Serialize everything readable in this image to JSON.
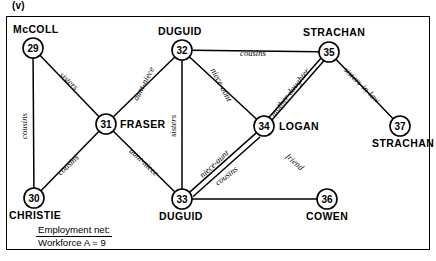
{
  "figure": {
    "panel_letter": "(v)",
    "caption_line1": "Employment net:",
    "caption_line2": "Workforce A = 9"
  },
  "graph_data": {
    "type": "diagram",
    "subtype": "social-network-graph",
    "nodes": [
      {
        "id": "29",
        "number": "29",
        "name": "McCOLL",
        "cx": 33,
        "cy": 48,
        "r": 10,
        "label_pos": "above",
        "label_x": 13,
        "label_y": 33
      },
      {
        "id": "32",
        "number": "32",
        "name": "DUGUID",
        "cx": 182,
        "cy": 50,
        "r": 10,
        "label_pos": "above",
        "label_x": 158,
        "label_y": 35
      },
      {
        "id": "35",
        "number": "35",
        "name": "STRACHAN",
        "cx": 329,
        "cy": 52,
        "r": 10,
        "label_pos": "above",
        "label_x": 303,
        "label_y": 36
      },
      {
        "id": "31",
        "number": "31",
        "name": "FRASER",
        "cx": 106,
        "cy": 124,
        "r": 10,
        "label_pos": "right",
        "label_x": 120,
        "label_y": 128
      },
      {
        "id": "34",
        "number": "34",
        "name": "LOGAN",
        "cx": 264,
        "cy": 126,
        "r": 10,
        "label_pos": "right",
        "label_x": 279,
        "label_y": 130
      },
      {
        "id": "37",
        "number": "37",
        "name": "STRACHAN",
        "cx": 400,
        "cy": 126,
        "r": 10,
        "label_pos": "below",
        "label_x": 372,
        "label_y": 147
      },
      {
        "id": "30",
        "number": "30",
        "name": "CHRISTIE",
        "cx": 34,
        "cy": 198,
        "r": 10,
        "label_pos": "below",
        "label_x": 9,
        "label_y": 219
      },
      {
        "id": "33",
        "number": "33",
        "name": "DUGUID",
        "cx": 182,
        "cy": 199,
        "r": 10,
        "label_pos": "below",
        "label_x": 159,
        "label_y": 220
      },
      {
        "id": "36",
        "number": "36",
        "name": "COWEN",
        "cx": 327,
        "cy": 199,
        "r": 10,
        "label_pos": "below",
        "label_x": 306,
        "label_y": 220
      }
    ],
    "edges": [
      {
        "from": "29",
        "to": "30",
        "label": "cousins",
        "double": false,
        "label_x": 27,
        "label_y": 126,
        "rotate": -90
      },
      {
        "from": "29",
        "to": "31",
        "label": "sisters",
        "double": false,
        "label_x": 67,
        "label_y": 83,
        "rotate": 43
      },
      {
        "from": "30",
        "to": "31",
        "label": "cousins",
        "double": false,
        "label_x": 70,
        "label_y": 167,
        "rotate": -43
      },
      {
        "from": "31",
        "to": "32",
        "label": "aunt-niece",
        "double": false,
        "label_x": 146,
        "label_y": 85,
        "rotate": -62
      },
      {
        "from": "31",
        "to": "33",
        "label": "aunt-niece",
        "double": false,
        "label_x": 142,
        "label_y": 164,
        "rotate": 43
      },
      {
        "from": "32",
        "to": "33",
        "label": "sisters",
        "double": false,
        "label_x": 176,
        "label_y": 126,
        "rotate": -90
      },
      {
        "from": "32",
        "to": "34",
        "label": "niece-aunt",
        "double": false,
        "label_x": 219,
        "label_y": 86,
        "rotate": 62
      },
      {
        "from": "32",
        "to": "35",
        "label": "cousins",
        "double": false,
        "label_x": 253,
        "label_y": 56,
        "rotate": 0
      },
      {
        "from": "33",
        "to": "34",
        "label": "niece-aunt",
        "double": false,
        "label_x": 216,
        "label_y": 166,
        "rotate": -43
      },
      {
        "from": "33",
        "to": "34",
        "label": "cousins",
        "double": false,
        "label_x": 228,
        "label_y": 178,
        "rotate": -37
      },
      {
        "from": "34",
        "to": "35",
        "label": "mother-daughter",
        "double": true,
        "label_x": 292,
        "label_y": 94,
        "rotate": -52
      },
      {
        "from": "33",
        "to": "36",
        "label": "friend",
        "double": false,
        "label_x": 293,
        "label_y": 164,
        "rotate": 42
      },
      {
        "from": "35",
        "to": "37",
        "label": "sisters-in-law",
        "double": false,
        "label_x": 360,
        "label_y": 87,
        "rotate": 45
      }
    ]
  }
}
